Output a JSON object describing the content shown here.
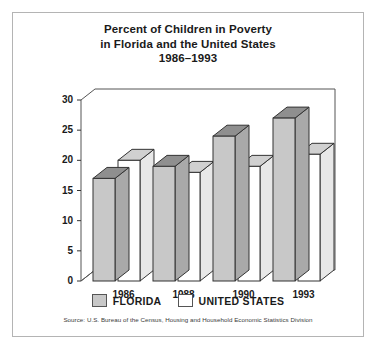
{
  "title": {
    "line1": "Percent of Children in Poverty",
    "line2": "in Florida and the United States",
    "line3": "1986–1993"
  },
  "legend": {
    "items": [
      {
        "label": "FLORIDA",
        "color": "#c8c8c8"
      },
      {
        "label": "UNITED STATES",
        "color": "#ffffff"
      }
    ]
  },
  "source": "Source: U.S. Bureau of the Census, Housing and Household Economic Statistics Division",
  "chart_data": {
    "type": "bar",
    "title": "Percent of Children in Poverty in Florida and the United States 1986–1993",
    "xlabel": "",
    "ylabel": "",
    "categories": [
      "1986",
      "1988",
      "1990",
      "1993"
    ],
    "series": [
      {
        "name": "FLORIDA",
        "color": "#c8c8c8",
        "values": [
          17,
          19,
          24,
          27
        ]
      },
      {
        "name": "UNITED STATES",
        "color": "#ffffff",
        "values": [
          20,
          18,
          19,
          21
        ]
      }
    ],
    "ylim": [
      0,
      30
    ],
    "yticks": [
      0,
      5,
      10,
      15,
      20,
      25,
      30
    ],
    "ytick_labels": [
      "0",
      "5",
      "10",
      "15",
      "20",
      "25",
      "30"
    ],
    "grid": false,
    "style": "3d-bar",
    "legend_position": "bottom"
  }
}
